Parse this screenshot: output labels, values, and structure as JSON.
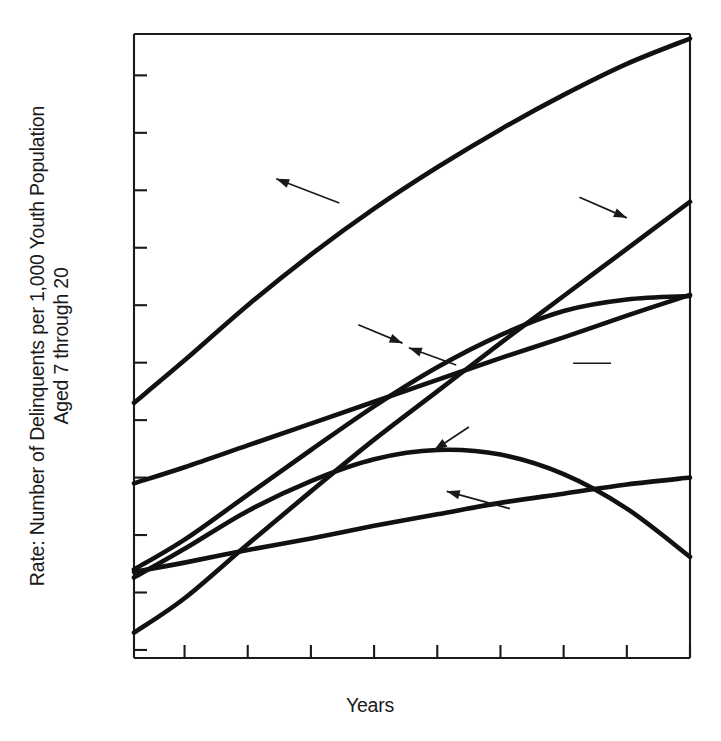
{
  "chart_data": {
    "type": "line",
    "title": "",
    "xlabel": "Years",
    "ylabel": "Rate: Number of Delinquents per 1,000 Youth Population Aged 7 through 20",
    "ylabel_line1": "Rate: Number of Delinquents per 1,000 Youth Population",
    "ylabel_line2": "Aged 7 through 20",
    "xlim": [
      53.2,
      62.0
    ],
    "ylim": [
      14.3,
      68.6
    ],
    "grid": false,
    "legend_position": "inline-annotations",
    "x_ticks": [
      54,
      55,
      56,
      57,
      58,
      59,
      60,
      61,
      62
    ],
    "x_tick_labels": [
      "54",
      "",
      "56",
      "",
      "58",
      "",
      "60",
      "",
      ""
    ],
    "x_labeled_ticks": [
      {
        "x": 54,
        "label": "54"
      },
      {
        "x": 56,
        "label": "56"
      },
      {
        "x": 58,
        "label": "58"
      },
      {
        "x": 60,
        "label": "60"
      }
    ],
    "y_ticks": [
      15,
      20,
      25,
      30,
      35,
      40,
      45,
      50,
      55,
      60,
      65
    ],
    "y_labeled_ticks": [
      {
        "y": 20,
        "label": "20"
      },
      {
        "y": 30,
        "label": "30"
      },
      {
        "y": 40,
        "label": "40"
      },
      {
        "y": 50,
        "label": "50"
      },
      {
        "y": 60,
        "label": "60"
      }
    ],
    "x": [
      53.2,
      54,
      55,
      56,
      57,
      58,
      59,
      60,
      61,
      62
    ],
    "series": [
      {
        "name": "Manhattan",
        "values": [
          36.5,
          40.2,
          45.0,
          49.4,
          53.4,
          57.0,
          60.3,
          63.3,
          66.0,
          68.2
        ],
        "label_x": 57.0,
        "label_y": 54.6,
        "arrow_from_x": 56.45,
        "arrow_from_y": 53.9,
        "arrow_to_x": 55.45,
        "arrow_to_y": 56.0
      },
      {
        "name": "Brooklyn",
        "values": [
          16.5,
          19.5,
          24.2,
          28.8,
          33.3,
          37.5,
          41.7,
          45.8,
          49.9,
          54.0
        ],
        "label_x": 59.05,
        "label_y": 54.8,
        "arrow_from_x": 60.25,
        "arrow_from_y": 54.4,
        "arrow_to_x": 61.0,
        "arrow_to_y": 52.6
      },
      {
        "name": "New York City",
        "values": [
          22.0,
          24.6,
          28.5,
          32.4,
          36.2,
          39.6,
          42.4,
          44.5,
          45.5,
          45.8
        ],
        "label_x": 55.1,
        "label_y": 43.8,
        "arrow_from_x": 56.75,
        "arrow_from_y": 43.3,
        "arrow_to_x": 57.45,
        "arrow_to_y": 41.7
      },
      {
        "name": "Bronx",
        "values": [
          29.5,
          30.9,
          32.8,
          34.7,
          36.6,
          38.5,
          40.4,
          42.2,
          44.1,
          45.9
        ],
        "label_x": 58.55,
        "label_y": 39.1,
        "arrow_from_x": 58.3,
        "arrow_from_y": 39.8,
        "arrow_to_x": 57.55,
        "arrow_to_y": 41.3
      },
      {
        "name": "Richmond",
        "values": [
          21.3,
          23.8,
          27.1,
          29.7,
          31.6,
          32.4,
          32.0,
          30.3,
          27.3,
          23.1
        ],
        "label_x": 58.65,
        "label_y": 35.1,
        "arrow_from_x": 58.5,
        "arrow_from_y": 34.4,
        "arrow_to_x": 57.95,
        "arrow_to_y": 32.4
      },
      {
        "name": "Queens",
        "values": [
          21.8,
          22.6,
          23.7,
          24.7,
          25.8,
          26.8,
          27.8,
          28.6,
          29.4,
          30.0
        ],
        "label_x": 59.3,
        "label_y": 26.8,
        "arrow_from_x": 59.15,
        "arrow_from_y": 27.3,
        "arrow_to_x": 58.15,
        "arrow_to_y": 28.8
      }
    ],
    "annotations": [
      {
        "name": "dash-mark",
        "x1": 60.15,
        "x2": 60.75,
        "y": 39.95
      }
    ]
  }
}
